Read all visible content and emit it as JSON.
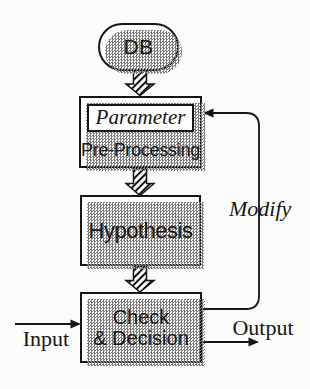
{
  "diagram": {
    "type": "flowchart",
    "nodes": {
      "db": {
        "label": "DB"
      },
      "parameter": {
        "label": "Parameter"
      },
      "preprocessing": {
        "label": "Pre-Processing"
      },
      "hypothesis": {
        "label": "Hypothesis"
      },
      "check_decision": {
        "line1": "Check",
        "line2": "& Decision"
      }
    },
    "edges": {
      "input": {
        "label": "Input"
      },
      "output": {
        "label": "Output"
      },
      "modify": {
        "label": "Modify"
      }
    },
    "colors": {
      "ink": "#161616",
      "paper": "#fbfbf9",
      "node_fill": "#fdfdfc",
      "shadow": "#7d7d7d"
    }
  }
}
